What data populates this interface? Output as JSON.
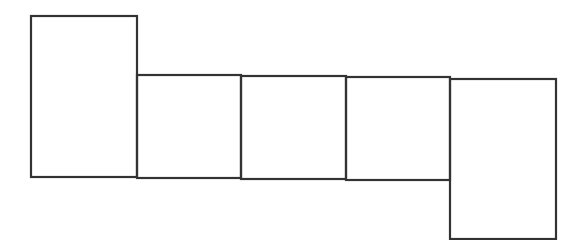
{
  "diagram": {
    "type": "net-of-rectangular-prism",
    "stroke_color": "#333333",
    "background_color": "#ffffff",
    "stroke_width": 2.2,
    "faces": [
      {
        "id": "face-1",
        "x": 31,
        "y": 16,
        "w": 106,
        "h": 161
      },
      {
        "id": "face-2",
        "x": 137,
        "y": 75,
        "w": 104,
        "h": 103
      },
      {
        "id": "face-3",
        "x": 241,
        "y": 76,
        "w": 105,
        "h": 103
      },
      {
        "id": "face-4",
        "x": 346,
        "y": 77,
        "w": 104,
        "h": 103
      },
      {
        "id": "face-5",
        "x": 450,
        "y": 79,
        "w": 106,
        "h": 160
      }
    ]
  }
}
